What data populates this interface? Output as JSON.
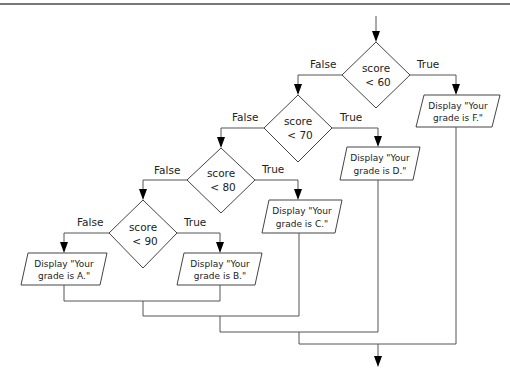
{
  "diagram": {
    "type": "flowchart",
    "decisions": [
      {
        "id": "d1",
        "line1": "score",
        "line2": "< 60",
        "false_label": "False",
        "true_label": "True"
      },
      {
        "id": "d2",
        "line1": "score",
        "line2": "< 70",
        "false_label": "False",
        "true_label": "True"
      },
      {
        "id": "d3",
        "line1": "score",
        "line2": "< 80",
        "false_label": "False",
        "true_label": "True"
      },
      {
        "id": "d4",
        "line1": "score",
        "line2": "< 90",
        "false_label": "False",
        "true_label": "True"
      }
    ],
    "outputs": [
      {
        "id": "oF",
        "line1": "Display \"Your",
        "line2": "grade is F.\""
      },
      {
        "id": "oD",
        "line1": "Display \"Your",
        "line2": "grade is D.\""
      },
      {
        "id": "oC",
        "line1": "Display \"Your",
        "line2": "grade is C.\""
      },
      {
        "id": "oB",
        "line1": "Display \"Your",
        "line2": "grade is B.\""
      },
      {
        "id": "oA",
        "line1": "Display \"Your",
        "line2": "grade is A.\""
      }
    ],
    "colors": {
      "stroke": "#444444",
      "text": "#222222",
      "background": "#ffffff"
    }
  }
}
